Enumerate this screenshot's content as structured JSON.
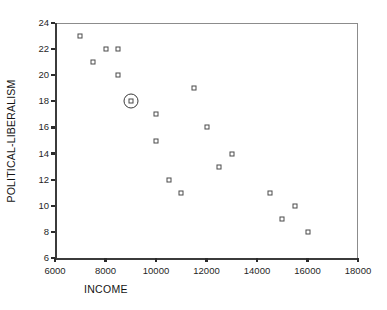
{
  "chart_data": {
    "type": "scatter",
    "title": "",
    "xlabel": "INCOME",
    "ylabel": "POLITICAL-LIBERALISM",
    "xlim": [
      6000,
      18000
    ],
    "ylim": [
      6,
      24
    ],
    "xticks": [
      6000,
      8000,
      10000,
      12000,
      14000,
      16000,
      18000
    ],
    "yticks": [
      6,
      8,
      10,
      12,
      14,
      16,
      18,
      20,
      22,
      24
    ],
    "xtick_labels": [
      "6000",
      "8000",
      "10000",
      "12000",
      "14000",
      "16000",
      "18000"
    ],
    "ytick_labels": [
      "6",
      "8",
      "10",
      "12",
      "14",
      "16",
      "18",
      "20",
      "22",
      "24"
    ],
    "grid": false,
    "legend": false,
    "marker": "open-square",
    "points": [
      {
        "x": 7000,
        "y": 23,
        "highlighted": false
      },
      {
        "x": 7500,
        "y": 21,
        "highlighted": false
      },
      {
        "x": 8000,
        "y": 22,
        "highlighted": false
      },
      {
        "x": 8500,
        "y": 22,
        "highlighted": false
      },
      {
        "x": 8500,
        "y": 20,
        "highlighted": false
      },
      {
        "x": 9000,
        "y": 18,
        "highlighted": true
      },
      {
        "x": 10000,
        "y": 17,
        "highlighted": false
      },
      {
        "x": 10000,
        "y": 15,
        "highlighted": false
      },
      {
        "x": 10500,
        "y": 12,
        "highlighted": false
      },
      {
        "x": 11000,
        "y": 11,
        "highlighted": false
      },
      {
        "x": 11500,
        "y": 19,
        "highlighted": false
      },
      {
        "x": 12000,
        "y": 16,
        "highlighted": false
      },
      {
        "x": 12500,
        "y": 13,
        "highlighted": false
      },
      {
        "x": 13000,
        "y": 14,
        "highlighted": false
      },
      {
        "x": 14500,
        "y": 11,
        "highlighted": false
      },
      {
        "x": 15000,
        "y": 9,
        "highlighted": false
      },
      {
        "x": 15500,
        "y": 10,
        "highlighted": false
      },
      {
        "x": 16000,
        "y": 8,
        "highlighted": false
      }
    ],
    "colors": {
      "marker_edge": "#4a4a4a",
      "marker_face": "#ffffff",
      "axis": "#3b3b3b",
      "frame": "#8c8c8c",
      "text": "#1a1a1a",
      "background": "#ffffff",
      "highlight_ring": "#3a3a3a"
    }
  }
}
